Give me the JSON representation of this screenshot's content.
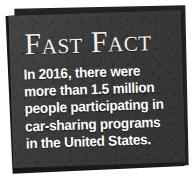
{
  "card": {
    "title": "Fast Fact",
    "body_lines": [
      "In 2016, there were",
      "more than 1.5 million",
      "people participating in",
      "car-sharing programs",
      "in the United States."
    ],
    "full_text": "In 2016, there were more than 1.5 million people participating in car-sharing programs in the United States.",
    "colors": {
      "card_front": "#3b3b3b",
      "card_mid": "#232323",
      "card_back": "#191919",
      "text": "#ffffff",
      "title_text": "#f4f2ee",
      "page_background": "#ffffff"
    }
  }
}
